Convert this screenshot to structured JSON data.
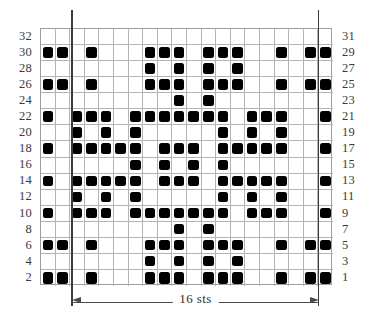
{
  "chart_data": {
    "type": "table",
    "title": "",
    "columns": 20,
    "rows": 16,
    "xlabel": "16 sts",
    "ylabel": "",
    "grid": true,
    "legend": [],
    "row_labels_left": [
      "32",
      "30",
      "28",
      "26",
      "24",
      "22",
      "20",
      "18",
      "16",
      "14",
      "12",
      "10",
      "8",
      "6",
      "4",
      "2"
    ],
    "row_labels_right": [
      "31",
      "29",
      "27",
      "25",
      "23",
      "21",
      "19",
      "17",
      "15",
      "13",
      "11",
      "9",
      "7",
      "5",
      "3",
      "1"
    ],
    "filled_cells": [
      [],
      [
        0,
        1,
        3,
        7,
        8,
        9,
        11,
        12,
        13,
        16,
        18,
        19
      ],
      [
        7,
        9,
        11,
        13
      ],
      [
        0,
        1,
        3,
        7,
        8,
        9,
        11,
        12,
        13,
        16,
        18,
        19
      ],
      [
        9,
        11
      ],
      [
        0,
        2,
        3,
        4,
        6,
        7,
        8,
        9,
        10,
        11,
        12,
        14,
        15,
        16,
        19
      ],
      [
        2,
        4,
        6,
        12,
        14,
        16
      ],
      [
        0,
        2,
        3,
        4,
        5,
        6,
        8,
        9,
        10,
        12,
        13,
        14,
        15,
        16,
        19
      ],
      [
        6,
        8,
        10,
        12
      ],
      [
        0,
        2,
        3,
        4,
        5,
        6,
        8,
        9,
        10,
        12,
        13,
        14,
        15,
        16,
        19
      ],
      [
        2,
        4,
        6,
        12,
        14,
        16
      ],
      [
        0,
        2,
        3,
        4,
        6,
        7,
        8,
        9,
        10,
        11,
        12,
        14,
        15,
        16,
        19
      ],
      [
        9,
        11
      ],
      [
        0,
        1,
        3,
        7,
        8,
        9,
        11,
        12,
        13,
        16,
        18,
        19
      ],
      [
        7,
        9,
        11,
        13
      ],
      [
        0,
        1,
        3,
        7,
        8,
        9,
        11,
        12,
        13,
        16,
        18,
        19
      ]
    ],
    "repeat_marker_columns": [
      2,
      19
    ],
    "colors": {
      "filled": "#000000",
      "empty": "#ffffff",
      "gridline": "#b4b4b4",
      "border": "#9d9d9d",
      "repeat_line": "#3b3b3b",
      "label_text": "#3a3a3a"
    }
  },
  "annotation": {
    "width_label": "16 sts"
  }
}
